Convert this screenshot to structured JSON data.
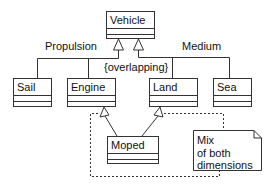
{
  "diagram": {
    "type": "UML class diagram",
    "classes": [
      {
        "id": "vehicle",
        "name": "Vehicle"
      },
      {
        "id": "sail",
        "name": "Sail"
      },
      {
        "id": "engine",
        "name": "Engine"
      },
      {
        "id": "land",
        "name": "Land"
      },
      {
        "id": "sea",
        "name": "Sea"
      },
      {
        "id": "moped",
        "name": "Moped"
      }
    ],
    "generalization_sets": [
      {
        "label": "Propulsion",
        "children": [
          "Sail",
          "Engine"
        ]
      },
      {
        "label": "Medium",
        "children": [
          "Land",
          "Sea"
        ]
      }
    ],
    "constraint": "{overlapping}",
    "note": {
      "lines": [
        "Mix",
        "of both",
        "dimensions"
      ]
    },
    "colors": {
      "line": "#333333",
      "background": "#ffffff"
    }
  }
}
